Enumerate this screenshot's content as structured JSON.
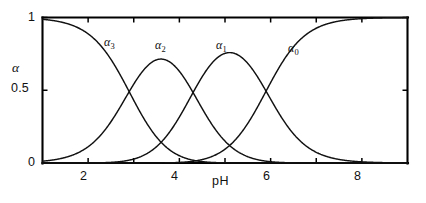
{
  "figure": {
    "background_color": "#ffffff",
    "line_color": "#111111",
    "axis_label_x": "pH",
    "axis_label_y": "α"
  },
  "chart_data": {
    "type": "line",
    "title": "",
    "subtitle": "",
    "xlabel": "pH",
    "ylabel": "α",
    "xlim": [
      1.0,
      9.0
    ],
    "ylim": [
      0.0,
      1.0
    ],
    "grid": false,
    "legend_position": "inline-curve-labels",
    "x_ticks": [
      2,
      4,
      6,
      8
    ],
    "x_tick_labels": [
      "2",
      "4",
      "6",
      "8"
    ],
    "x_minor_ticks": [
      3,
      5,
      7
    ],
    "y_ticks": [
      0,
      0.5,
      1
    ],
    "y_tick_labels": [
      "0",
      "0.5",
      "1"
    ],
    "pka_values": [
      2.9,
      4.3,
      5.9
    ],
    "crossover_points": [
      {
        "pH": 2.9,
        "alpha": 0.5,
        "species": [
          "α3",
          "α2"
        ]
      },
      {
        "pH": 4.3,
        "alpha": 0.5,
        "species": [
          "α2",
          "α1"
        ]
      },
      {
        "pH": 5.9,
        "alpha": 0.5,
        "species": [
          "α1",
          "α0"
        ]
      }
    ],
    "series": [
      {
        "name": "α3",
        "label": "α",
        "subscript": "3",
        "protons": 3,
        "label_x": 2.95,
        "label_y": 0.8,
        "label_px": {
          "x": 104,
          "y": 36
        }
      },
      {
        "name": "α2",
        "label": "α",
        "subscript": "2",
        "protons": 2,
        "label_x": 3.98,
        "label_y": 0.78,
        "label_px": {
          "x": 155,
          "y": 39
        }
      },
      {
        "name": "α1",
        "label": "α",
        "subscript": "1",
        "protons": 1,
        "label_x": 5.32,
        "label_y": 0.78,
        "label_px": {
          "x": 216,
          "y": 39
        }
      },
      {
        "name": "α0",
        "label": "α",
        "subscript": "0",
        "protons": 0,
        "label_x": 6.86,
        "label_y": 0.72,
        "label_px": {
          "x": 288,
          "y": 42
        }
      }
    ],
    "x": [
      1.0,
      1.2,
      1.4,
      1.6,
      1.8,
      2.0,
      2.2,
      2.4,
      2.6,
      2.8,
      3.0,
      3.2,
      3.4,
      3.6,
      3.8,
      4.0,
      4.2,
      4.4,
      4.6,
      4.8,
      5.0,
      5.2,
      5.4,
      5.6,
      5.8,
      6.0,
      6.2,
      6.4,
      6.6,
      6.8,
      7.0,
      7.2,
      7.4,
      7.6,
      7.8,
      8.0,
      8.2,
      8.4,
      8.6,
      8.8,
      9.0
    ],
    "values_alpha3": [
      0.988,
      0.981,
      0.97,
      0.953,
      0.928,
      0.891,
      0.839,
      0.769,
      0.68,
      0.576,
      0.465,
      0.356,
      0.258,
      0.177,
      0.116,
      0.072,
      0.043,
      0.024,
      0.013,
      0.007,
      0.004,
      0.002,
      0.001,
      0.0,
      0.0,
      0.0,
      0.0,
      0.0,
      0.0,
      0.0,
      0.0,
      0.0,
      0.0,
      0.0,
      0.0,
      0.0,
      0.0,
      0.0,
      0.0,
      0.0,
      0.0
    ],
    "values_alpha2": [
      0.012,
      0.019,
      0.03,
      0.047,
      0.072,
      0.109,
      0.161,
      0.23,
      0.319,
      0.421,
      0.525,
      0.618,
      0.686,
      0.723,
      0.726,
      0.697,
      0.641,
      0.565,
      0.478,
      0.388,
      0.302,
      0.226,
      0.163,
      0.114,
      0.077,
      0.051,
      0.033,
      0.021,
      0.013,
      0.008,
      0.005,
      0.003,
      0.002,
      0.001,
      0.001,
      0.0,
      0.0,
      0.0,
      0.0,
      0.0,
      0.0
    ],
    "values_alpha1": [
      0.0,
      0.0,
      0.0,
      0.001,
      0.002,
      0.003,
      0.006,
      0.014,
      0.03,
      0.063,
      0.124,
      0.231,
      0.406,
      0.678,
      1.0,
      1.0,
      1.0,
      1.0,
      1.0,
      1.0,
      1.0,
      1.0,
      1.0,
      1.0,
      0.966,
      0.8,
      0.6,
      0.4,
      0.24,
      0.132,
      0.068,
      0.034,
      0.016,
      0.008,
      0.004,
      0.002,
      0.001,
      0.0,
      0.0,
      0.0,
      0.0
    ],
    "values_alpha0": [
      0.0,
      0.0,
      0.0,
      0.0,
      0.0,
      0.0,
      0.0,
      0.0,
      0.0,
      0.0,
      0.001,
      0.002,
      0.004,
      0.009,
      0.019,
      0.039,
      0.077,
      0.145,
      0.25,
      0.386,
      0.532,
      0.664,
      0.768,
      0.845,
      0.899,
      0.936,
      0.96,
      0.975,
      0.985,
      0.991,
      0.994,
      0.997,
      0.998,
      0.999,
      0.999,
      1.0,
      1.0,
      1.0,
      1.0,
      1.0
    ]
  },
  "ticks": {
    "y_1": "1",
    "y_05": "0.5",
    "y_0": "0",
    "x_2": "2",
    "x_4": "4",
    "x_6": "6",
    "x_8": "8"
  }
}
